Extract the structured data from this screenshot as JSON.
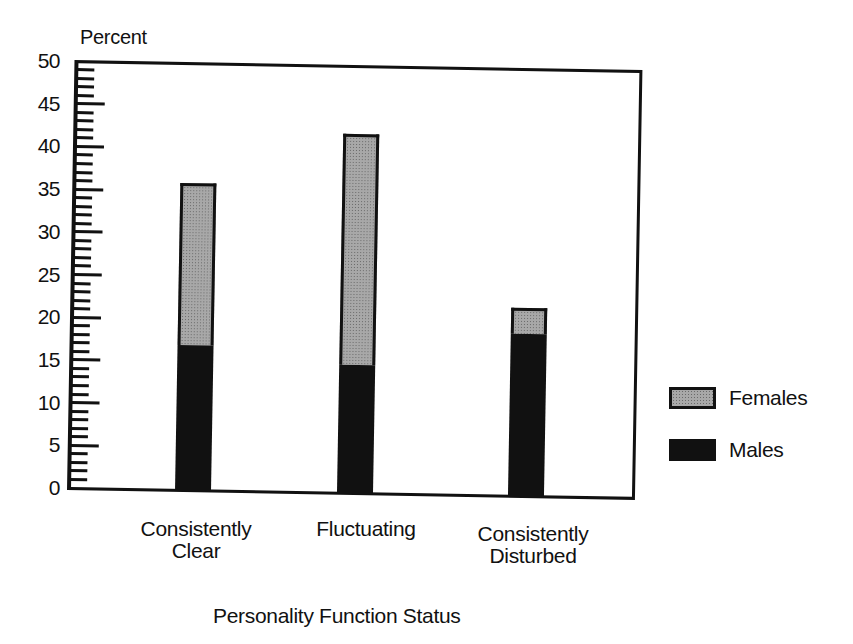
{
  "chart_data": {
    "type": "bar",
    "stacked": true,
    "title": "",
    "xlabel": "Personality Function Status",
    "ylabel": "Percent",
    "ylim": [
      0,
      50
    ],
    "yticks_major": [
      0,
      5,
      10,
      15,
      20,
      25,
      30,
      35,
      40,
      45,
      50
    ],
    "ytick_minor_step": 1,
    "grid": false,
    "legend_position": "right",
    "categories": [
      "Consistently Clear",
      "Fluctuating",
      "Consistently Disturbed"
    ],
    "category_lines": [
      [
        "Consistently",
        "Clear"
      ],
      [
        "Fluctuating"
      ],
      [
        "Consistently",
        "Disturbed"
      ]
    ],
    "series": [
      {
        "name": "Males",
        "values": [
          17,
          15,
          19
        ],
        "color": "#111111",
        "pattern": "solid"
      },
      {
        "name": "Females",
        "values": [
          19,
          27,
          3
        ],
        "color": "#a8a8a8",
        "pattern": "stipple"
      }
    ],
    "totals": [
      36,
      42,
      22
    ]
  },
  "labels": {
    "y_title": "Percent",
    "x_title": "Personality Function Status",
    "yticks": [
      "0",
      "5",
      "10",
      "15",
      "20",
      "25",
      "30",
      "35",
      "40",
      "45",
      "50"
    ],
    "cat0_line1": "Consistently",
    "cat0_line2": "Clear",
    "cat1_line1": "Fluctuating",
    "cat2_line1": "Consistently",
    "cat2_line2": "Disturbed"
  },
  "legend": {
    "females": "Females",
    "males": "Males"
  },
  "colors": {
    "ink": "#111111",
    "females_fill": "#a8a8a8",
    "males_fill": "#111111",
    "background": "#ffffff"
  }
}
